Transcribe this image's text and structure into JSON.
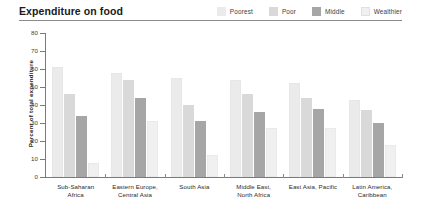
{
  "header": {
    "title": "Expenditure on food"
  },
  "legend": {
    "position": "top-right",
    "items": [
      {
        "label": "Poorest",
        "color": "#ebebeb"
      },
      {
        "label": "Poor",
        "color": "#d9d9d9"
      },
      {
        "label": "Middle",
        "color": "#a6a6a6"
      },
      {
        "label": "Wealthier",
        "color": "#f0f0f0"
      }
    ]
  },
  "axes": {
    "y_title": "Percent of total expenditure",
    "y_ticks": [
      0,
      10,
      20,
      30,
      40,
      50,
      60,
      70,
      80
    ],
    "y_min": 0,
    "y_max": 80
  },
  "chart_data": {
    "type": "bar",
    "title": "Expenditure on food",
    "xlabel": "",
    "ylabel": "Percent of total expenditure",
    "ylim": [
      0,
      80
    ],
    "grid": false,
    "legend_position": "top-right",
    "categories": [
      "Sub-Saharan Africa",
      "Eastern Europe, Central Asia",
      "South Asia",
      "Middle East, North Africa",
      "East Asia, Pacific",
      "Latin America, Caribbean"
    ],
    "category_lines": [
      [
        "Sub-Saharan",
        "Africa"
      ],
      [
        "Eastern Europe,",
        "Central Asia"
      ],
      [
        "South Asia"
      ],
      [
        "Middle East,",
        "North Africa"
      ],
      [
        "East Asia, Pacific"
      ],
      [
        "Latin America,",
        "Caribbean"
      ]
    ],
    "series": [
      {
        "name": "Poorest",
        "color": "#ebebeb",
        "values": [
          61,
          58,
          55,
          54,
          52,
          43
        ]
      },
      {
        "name": "Poor",
        "color": "#d9d9d9",
        "values": [
          46,
          54,
          40,
          46,
          44,
          37
        ]
      },
      {
        "name": "Middle",
        "color": "#a6a6a6",
        "values": [
          34,
          44,
          31,
          36,
          38,
          30
        ]
      },
      {
        "name": "Wealthier",
        "color": "#f0f0f0",
        "values": [
          8,
          31,
          12,
          27,
          27,
          18
        ]
      }
    ]
  }
}
